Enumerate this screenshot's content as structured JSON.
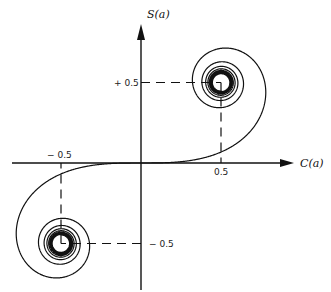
{
  "chart_data": {
    "type": "line",
    "xlabel": "C(a)",
    "ylabel": "S(a)",
    "xlim": [
      -0.8,
      0.95
    ],
    "ylim": [
      -0.75,
      0.85
    ],
    "grid": false,
    "ticks": {
      "x_pos": {
        "value": 0.5,
        "label": "0.5"
      },
      "x_neg": {
        "value": -0.5,
        "label": "− 0.5"
      },
      "y_pos": {
        "value": 0.5,
        "label": "+ 0.5"
      },
      "y_neg": {
        "value": -0.5,
        "label": "− 0.5"
      }
    },
    "asymptotic_points": [
      [
        0.5,
        0.5
      ],
      [
        -0.5,
        -0.5
      ]
    ],
    "series": [
      {
        "name": "Fresnel integrals (C(a), S(a))",
        "a_range": [
          -6,
          6
        ]
      }
    ]
  }
}
